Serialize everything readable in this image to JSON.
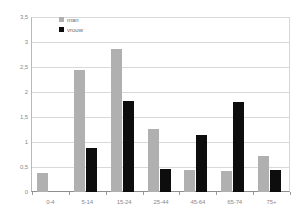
{
  "chart_data": {
    "type": "bar",
    "title": "",
    "subtitle": "",
    "xlabel": "",
    "ylabel": "",
    "categories": [
      "0-4",
      "5-14",
      "15-24",
      "25-44",
      "45-64",
      "65-74",
      "75+"
    ],
    "series": [
      {
        "name": "man",
        "color": "#b0b0b0",
        "values": [
          0.38,
          2.45,
          2.86,
          1.26,
          0.44,
          0.42,
          0.72
        ]
      },
      {
        "name": "vrouw",
        "color": "#0d0d0d",
        "values": [
          0,
          0.88,
          1.83,
          0.46,
          1.14,
          1.8,
          0.44
        ]
      }
    ],
    "ylim": [
      0,
      3.5
    ],
    "ytick_values": [
      0,
      0.5,
      1,
      1.5,
      2,
      2.5,
      3,
      3.5
    ],
    "ytick_labels": [
      "0",
      "0,5",
      "1",
      "1,5",
      "2",
      "2,5",
      "3",
      "3,5"
    ],
    "grid": true,
    "legend_position": "top-left",
    "legend": [
      {
        "label": "man",
        "color": "#b0b0b0"
      },
      {
        "label": "vrouw",
        "color": "#0d0d0d"
      }
    ]
  },
  "colors": {
    "series_man": "#b0b0b0",
    "series_vrouw": "#0d0d0d",
    "gridline": "#d9d9d9",
    "axis": "#8e8e8e",
    "tick_text": "#8a8a8a",
    "legend_text": "#6d6d6d",
    "background": "#ffffff"
  }
}
